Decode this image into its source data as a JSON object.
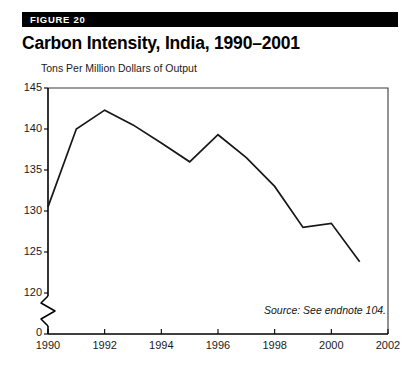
{
  "figure": {
    "label": "FIGURE 20",
    "title": "Carbon Intensity, India, 1990–2001",
    "source_note": "Source: See endnote 104."
  },
  "colors": {
    "bar_background": "#000000",
    "bar_text": "#ffffff",
    "line": "#171717",
    "axis": "#000000",
    "page_background": "#ffffff"
  },
  "chart_data": {
    "type": "line",
    "title": "Carbon Intensity, India, 1990–2001",
    "subtitle": "",
    "xlabel": "",
    "ylabel": "Tons Per Million Dollars of Output",
    "x": [
      1990,
      1991,
      1992,
      1993,
      1994,
      1995,
      1996,
      1997,
      1998,
      1999,
      2000,
      2001
    ],
    "values": [
      130.5,
      140.0,
      142.3,
      140.5,
      138.3,
      136.0,
      139.3,
      136.5,
      133.0,
      128.0,
      128.5,
      123.8
    ],
    "series": [
      {
        "name": "Carbon intensity",
        "values": [
          130.5,
          140.0,
          142.3,
          140.5,
          138.3,
          136.0,
          139.3,
          136.5,
          133.0,
          128.0,
          128.5,
          123.8
        ]
      }
    ],
    "xlim": [
      1990,
      2002
    ],
    "ylim": [
      120,
      145
    ],
    "y_axis_broken": true,
    "y_break_label": "0",
    "yticks": [
      145,
      140,
      135,
      130,
      125,
      120
    ],
    "ytick_labels": [
      "145",
      "140",
      "135",
      "130",
      "125",
      "120"
    ],
    "xticks": [
      1990,
      1992,
      1994,
      1996,
      1998,
      2000,
      2002
    ],
    "xtick_labels": [
      "1990",
      "1992",
      "1994",
      "1996",
      "1998",
      "2000",
      "2002"
    ],
    "grid": false,
    "legend": false,
    "legend_position": "none",
    "annotations": [
      "Source: See endnote 104."
    ]
  }
}
